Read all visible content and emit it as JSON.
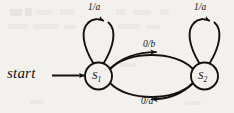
{
  "diagram": {
    "type": "state-transition-diagram",
    "title": "",
    "colors": {
      "ink": "#14110f",
      "paper": "#f2f1ed",
      "artifact": "#dcd9d2"
    },
    "start": {
      "label": "start",
      "target_state": "S1"
    },
    "states": [
      {
        "id": "S1",
        "name": "S",
        "subscript": "1",
        "cx": 98.5,
        "cy": 76,
        "r": 13.5
      },
      {
        "id": "S2",
        "name": "S",
        "subscript": "2",
        "cx": 204.5,
        "cy": 76,
        "r": 13.5
      }
    ],
    "transitions": [
      {
        "id": "loop-s1",
        "from": "S1",
        "to": "S1",
        "label": "1/a",
        "kind": "self-loop",
        "label_x": 88,
        "label_y": 3
      },
      {
        "id": "loop-s2",
        "from": "S2",
        "to": "S2",
        "label": "1/a",
        "kind": "self-loop",
        "label_x": 194,
        "label_y": 3
      },
      {
        "id": "s1-to-s2",
        "from": "S1",
        "to": "S2",
        "label": "0/b",
        "kind": "curve-top",
        "label_x": 143,
        "label_y": 40
      },
      {
        "id": "s2-to-s1",
        "from": "S2",
        "to": "S1",
        "label": "0/a",
        "kind": "curve-bottom",
        "label_x": 141,
        "label_y": 97
      }
    ]
  }
}
